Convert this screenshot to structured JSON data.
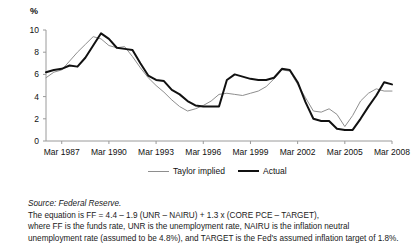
{
  "axis": {
    "y_unit": "%",
    "y_ticks": [
      "10",
      "8",
      "6",
      "4",
      "2",
      "0"
    ],
    "x_ticks": [
      "Mar 1987",
      "Mar 1990",
      "Mar 1993",
      "Mar 1996",
      "Mar 1999",
      "Mar 2002",
      "Mar 2005",
      "Mar 2008"
    ]
  },
  "legend": {
    "taylor_label": "Taylor implied",
    "actual_label": "Actual"
  },
  "notes": {
    "source": "Source: Federal Reserve.",
    "line1": "The equation is FF = 4.4 – 1.9  (UNR – NAIRU) + 1.3 x (CORE PCE – TARGET),",
    "line2": "where FF is the funds rate, UNR is the unemployment rate, NAIRU is the inflation neutral",
    "line3": "unemployment rate (assumed to be 4.8%), and TARGET is the Fed's assumed inflation target of 1.8%."
  },
  "colors": {
    "taylor": "#8e8e8e",
    "actual": "#111111",
    "axis": "#9a9a9a"
  },
  "chart_data": {
    "type": "line",
    "title": "",
    "xlabel": "",
    "ylabel": "%",
    "ylim": [
      0,
      10
    ],
    "xlim": [
      "Mar 1986",
      "Mar 2008"
    ],
    "grid": false,
    "legend_position": "bottom-center",
    "x": [
      "Mar 1986",
      "Sep 1986",
      "Mar 1987",
      "Sep 1987",
      "Mar 1988",
      "Sep 1988",
      "Mar 1989",
      "Sep 1989",
      "Mar 1990",
      "Sep 1990",
      "Mar 1991",
      "Sep 1991",
      "Mar 1992",
      "Sep 1992",
      "Mar 1993",
      "Sep 1993",
      "Mar 1994",
      "Sep 1994",
      "Mar 1995",
      "Sep 1995",
      "Mar 1996",
      "Sep 1996",
      "Mar 1997",
      "Sep 1997",
      "Mar 1998",
      "Sep 1998",
      "Mar 1999",
      "Sep 1999",
      "Mar 2000",
      "Sep 2000",
      "Mar 2001",
      "Sep 2001",
      "Mar 2002",
      "Sep 2002",
      "Mar 2003",
      "Sep 2003",
      "Mar 2004",
      "Sep 2004",
      "Mar 2005",
      "Sep 2005",
      "Mar 2006",
      "Sep 2006",
      "Mar 2007",
      "Sep 2007",
      "Mar 2008"
    ],
    "series": [
      {
        "name": "Taylor implied",
        "color": "#8e8e8e",
        "width": 1.0,
        "values": [
          5.7,
          6.2,
          6.4,
          7.2,
          8.0,
          8.7,
          9.4,
          9.2,
          8.6,
          8.4,
          8.5,
          7.6,
          6.6,
          5.7,
          5.0,
          4.4,
          3.7,
          3.1,
          2.7,
          2.9,
          3.2,
          3.6,
          4.2,
          4.3,
          4.2,
          4.1,
          4.3,
          4.5,
          4.9,
          5.6,
          6.4,
          6.3,
          5.1,
          3.9,
          2.7,
          2.6,
          2.9,
          2.4,
          1.3,
          2.3,
          3.6,
          4.3,
          4.7,
          4.5,
          4.5
        ]
      },
      {
        "name": "Actual",
        "color": "#111111",
        "width": 2.0,
        "values": [
          6.2,
          6.4,
          6.5,
          6.8,
          6.7,
          7.5,
          8.6,
          9.7,
          9.2,
          8.4,
          8.3,
          8.2,
          7.0,
          5.9,
          5.5,
          5.4,
          4.6,
          4.2,
          3.6,
          3.2,
          3.1,
          3.1,
          3.1,
          5.5,
          6.0,
          5.8,
          5.6,
          5.5,
          5.5,
          5.7,
          6.5,
          6.4,
          5.3,
          3.5,
          2.0,
          1.8,
          1.8,
          1.1,
          1.0,
          1.0,
          2.0,
          3.1,
          4.1,
          5.3,
          5.1
        ]
      }
    ]
  }
}
